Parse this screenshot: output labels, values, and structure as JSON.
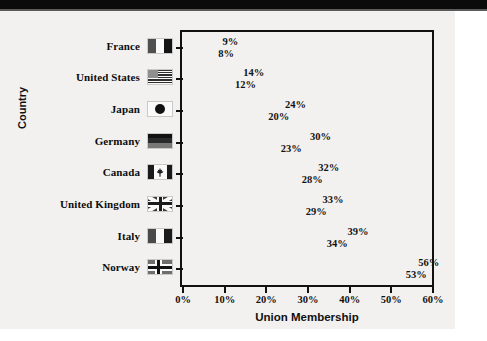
{
  "chart_data": {
    "type": "bar",
    "orientation": "horizontal",
    "title": "",
    "xlabel": "Union Membership",
    "ylabel": "Country",
    "categories": [
      "France",
      "United States",
      "Japan",
      "Germany",
      "Canada",
      "United Kingdom",
      "Italy",
      "Norway"
    ],
    "series": [
      {
        "name": "series-1",
        "values": [
          9,
          14,
          24,
          30,
          32,
          33,
          39,
          56
        ]
      },
      {
        "name": "series-2",
        "values": [
          8,
          12,
          20,
          23,
          28,
          29,
          34,
          53
        ]
      }
    ],
    "value_labels": [
      [
        "9%",
        "8%"
      ],
      [
        "14%",
        "12%"
      ],
      [
        "24%",
        "20%"
      ],
      [
        "30%",
        "23%"
      ],
      [
        "32%",
        "28%"
      ],
      [
        "33%",
        "29%"
      ],
      [
        "39%",
        "34%"
      ],
      [
        "56%",
        "53%"
      ]
    ],
    "xlim": [
      0,
      60
    ],
    "xticks": [
      0,
      10,
      20,
      30,
      40,
      50,
      60
    ],
    "xtick_labels": [
      "0%",
      "10%",
      "20%",
      "30%",
      "40%",
      "50%",
      "60%"
    ],
    "grid": false,
    "legend": "none",
    "bar_colors": [
      [
        "#4a4a4a",
        "#4a4a4a"
      ],
      [
        "#2b2b2b",
        "#2b2b2b"
      ],
      [
        "#3d3d3d",
        "#3d3d3d"
      ],
      [
        "#b0b0b0",
        "#a8a8a8"
      ],
      [
        "#4f4f4f",
        "#3a3a3a"
      ],
      [
        "#3c3c3c",
        "#2e2e2e"
      ],
      [
        "#8c8c8c",
        "#7e7e7e"
      ],
      [
        "#9a9a9a",
        "#9a9a9a"
      ]
    ],
    "frame_color": "#111111",
    "plot_background": "#f2f1ef",
    "page_background": "#f2f1ef"
  },
  "flags": {
    "France": "flag-france-icon",
    "United States": "flag-united-states-icon",
    "Japan": "flag-japan-icon",
    "Germany": "flag-germany-icon",
    "Canada": "flag-canada-icon",
    "United Kingdom": "flag-united-kingdom-icon",
    "Italy": "flag-italy-icon",
    "Norway": "flag-norway-icon"
  }
}
